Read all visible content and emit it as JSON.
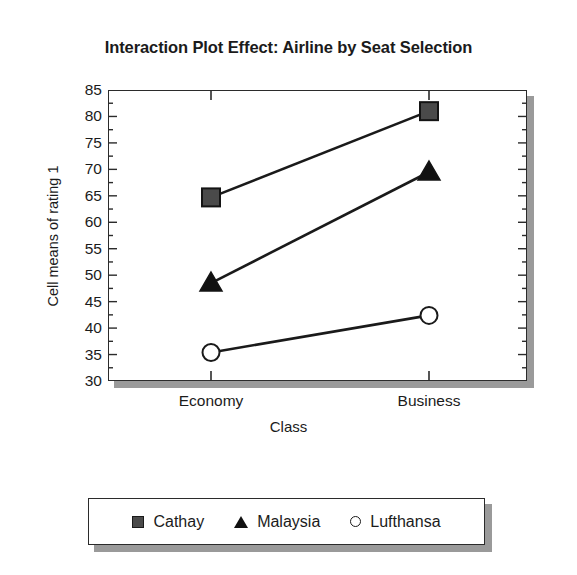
{
  "chart_data": {
    "type": "line",
    "title": "Interaction Plot Effect: Airline by Seat Selection",
    "xlabel": "Class",
    "ylabel": "Cell means of rating 1",
    "categories": [
      "Economy",
      "Business"
    ],
    "ylim": [
      30,
      85
    ],
    "yticks": [
      85,
      80,
      75,
      70,
      65,
      60,
      55,
      50,
      45,
      40,
      35,
      30
    ],
    "grid": false,
    "legend_position": "bottom",
    "series": [
      {
        "name": "Cathay",
        "marker": "filled-square",
        "color": "#4a4a4a",
        "values": [
          64.7,
          81.0
        ]
      },
      {
        "name": "Malaysia",
        "marker": "filled-triangle",
        "color": "#111111",
        "values": [
          48.5,
          69.5
        ]
      },
      {
        "name": "Lufthansa",
        "marker": "open-circle",
        "color": "#ffffff",
        "values": [
          35.4,
          42.4
        ]
      }
    ]
  },
  "legend": {
    "entries": [
      {
        "label": "Cathay"
      },
      {
        "label": "Malaysia"
      },
      {
        "label": "Lufthansa"
      }
    ]
  }
}
